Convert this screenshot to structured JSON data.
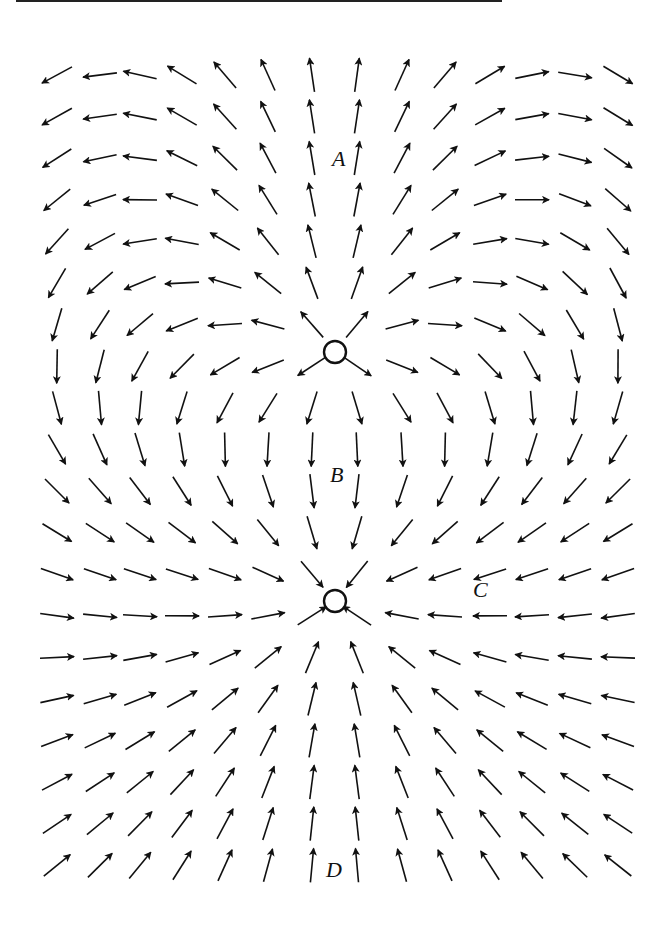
{
  "diagram": {
    "type": "vector-field",
    "charges": [
      {
        "name": "upper-charge",
        "x": 335,
        "y": 352,
        "q": 1.0
      },
      {
        "name": "lower-charge",
        "x": 335,
        "y": 601,
        "q": -2.2
      }
    ],
    "grid": {
      "columns": [
        57,
        100,
        140,
        182,
        225,
        268,
        312,
        357,
        402,
        445,
        490,
        532,
        575,
        618
      ],
      "row_start": 75,
      "row_step": 41.6,
      "row_count": 20,
      "arrow_length": 34
    },
    "labels": [
      {
        "text": "A",
        "x": 332,
        "y": 166
      },
      {
        "text": "B",
        "x": 330,
        "y": 482
      },
      {
        "text": "C",
        "x": 473,
        "y": 597
      },
      {
        "text": "D",
        "x": 326,
        "y": 877
      }
    ],
    "colors": {
      "ink": "#111111",
      "background": "#ffffff"
    }
  }
}
